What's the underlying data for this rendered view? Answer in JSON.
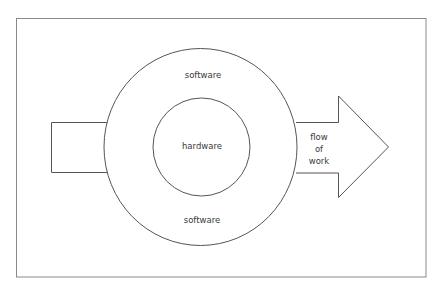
{
  "diagram": {
    "type": "concentric-layers-with-flow-arrow",
    "outer_ring": {
      "label_top": "software",
      "label_bottom": "software"
    },
    "inner_circle": {
      "label": "hardware"
    },
    "arrow": {
      "label_lines": [
        "flow",
        "of",
        "work"
      ],
      "direction": "left-to-right"
    },
    "colors": {
      "stroke": "#555555",
      "frame": "#8a8a8a",
      "text": "#3a3a3a",
      "background": "#ffffff"
    }
  }
}
